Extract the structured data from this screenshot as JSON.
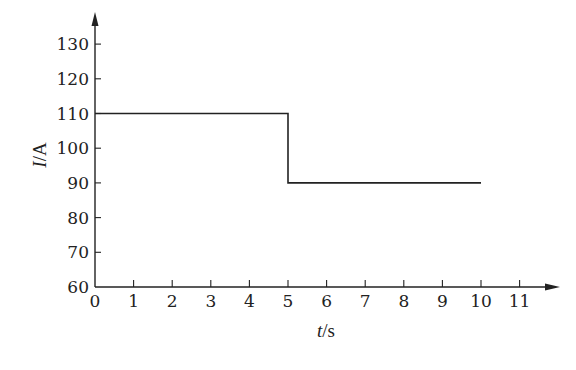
{
  "chart_data": {
    "type": "line",
    "title": "",
    "xlabel": "t/s",
    "xlabel_var": "t",
    "xlabel_unit": "/s",
    "ylabel": "I/A",
    "ylabel_var": "I",
    "ylabel_unit": "/A",
    "xlim": [
      0,
      11
    ],
    "ylim": [
      60,
      130
    ],
    "x_ticks": [
      0,
      1,
      2,
      3,
      4,
      5,
      6,
      7,
      8,
      9,
      10,
      11
    ],
    "y_ticks": [
      60,
      70,
      80,
      90,
      100,
      110,
      120,
      130
    ],
    "grid": false,
    "legend": null,
    "series": [
      {
        "name": "I(t)",
        "step": true,
        "points": [
          {
            "x": 0,
            "y": 110
          },
          {
            "x": 5,
            "y": 110
          },
          {
            "x": 5,
            "y": 90
          },
          {
            "x": 10,
            "y": 90
          }
        ]
      }
    ],
    "line_color": "#222222"
  }
}
